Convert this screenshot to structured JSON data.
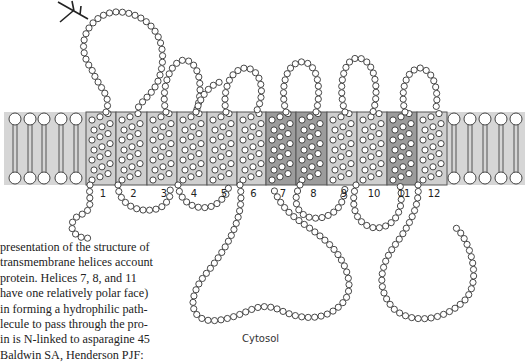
{
  "figure": {
    "region_label": "Cytosol",
    "helix_labels": [
      "1",
      "2",
      "3",
      "4",
      "5",
      "6",
      "7",
      "8",
      "9",
      "10",
      "11",
      "12"
    ],
    "dark_helices": [
      7,
      8,
      11
    ],
    "colors": {
      "membrane": "#d4d4d4",
      "helix_light": "#cfcfcf",
      "helix_dark": "#9c9c9c",
      "bead_stroke": "#333333",
      "border": "#555555"
    }
  },
  "caption": {
    "lines": [
      "presentation of the structure of",
      "transmembrane helices account",
      " protein. Helices 7, 8, and 11",
      " have one relatively polar face)",
      " in forming a hydrophilic path-",
      "lecule to pass through the pro-",
      "in is N-linked to asparagine 45",
      " Baldwin SA, Henderson PJF:"
    ]
  }
}
